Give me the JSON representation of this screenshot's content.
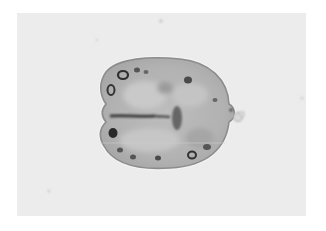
{
  "image": {
    "type": "micrograph",
    "subject": "ovoid cell / cyst with granular cytoplasm, peripheral dark inclusions, central linear dark structure",
    "colors": {
      "border": "#ffffff",
      "field": "#ececec",
      "cell_fill": "#b8b8b8",
      "cell_wall": "#8a8a8a",
      "inclusions": "#3a3a3a"
    }
  }
}
